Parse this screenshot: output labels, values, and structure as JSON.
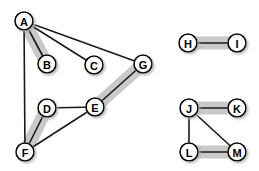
{
  "figure": {
    "background_color": "#ffffff",
    "width": 259,
    "height": 171
  },
  "style": {
    "node_fill": "#ffffff",
    "node_stroke": "#000000",
    "node_stroke_width": 1.6,
    "node_radius": 9,
    "node_label_color": "#000000",
    "node_label_size": 11,
    "edge_color": "#1a1a1a",
    "edge_width": 1.6,
    "highlight_color": "#c9c9c9",
    "highlight_width": 13,
    "node_shadow_color": "#b5b5b5"
  },
  "nodes": [
    {
      "id": "A",
      "label": "A",
      "x": 24,
      "y": 21
    },
    {
      "id": "B",
      "label": "B",
      "x": 47,
      "y": 64
    },
    {
      "id": "C",
      "label": "C",
      "x": 94,
      "y": 65
    },
    {
      "id": "D",
      "label": "D",
      "x": 47,
      "y": 108
    },
    {
      "id": "E",
      "label": "E",
      "x": 95,
      "y": 107
    },
    {
      "id": "F",
      "label": "F",
      "x": 25,
      "y": 152
    },
    {
      "id": "G",
      "label": "G",
      "x": 143,
      "y": 64
    },
    {
      "id": "H",
      "label": "H",
      "x": 188,
      "y": 43
    },
    {
      "id": "I",
      "label": "I",
      "x": 237,
      "y": 43
    },
    {
      "id": "J",
      "label": "J",
      "x": 189,
      "y": 108
    },
    {
      "id": "K",
      "label": "K",
      "x": 237,
      "y": 108
    },
    {
      "id": "L",
      "label": "L",
      "x": 189,
      "y": 152
    },
    {
      "id": "M",
      "label": "M",
      "x": 237,
      "y": 152
    }
  ],
  "edges": [
    {
      "source": "A",
      "target": "B",
      "highlighted": true
    },
    {
      "source": "A",
      "target": "C",
      "highlighted": false
    },
    {
      "source": "A",
      "target": "G",
      "highlighted": false
    },
    {
      "source": "A",
      "target": "F",
      "highlighted": false
    },
    {
      "source": "D",
      "target": "E",
      "highlighted": false
    },
    {
      "source": "D",
      "target": "F",
      "highlighted": true
    },
    {
      "source": "E",
      "target": "F",
      "highlighted": false
    },
    {
      "source": "E",
      "target": "G",
      "highlighted": true
    },
    {
      "source": "H",
      "target": "I",
      "highlighted": true
    },
    {
      "source": "J",
      "target": "K",
      "highlighted": true
    },
    {
      "source": "J",
      "target": "L",
      "highlighted": false
    },
    {
      "source": "J",
      "target": "M",
      "highlighted": false
    },
    {
      "source": "L",
      "target": "M",
      "highlighted": true
    }
  ],
  "components": [
    {
      "name": "component-1",
      "nodes": [
        "A",
        "B",
        "C",
        "D",
        "E",
        "F",
        "G"
      ]
    },
    {
      "name": "component-2",
      "nodes": [
        "H",
        "I"
      ]
    },
    {
      "name": "component-3",
      "nodes": [
        "J",
        "K",
        "L",
        "M"
      ]
    }
  ],
  "matching": {
    "name": "highlighted-matching",
    "edges": [
      "A-B",
      "D-F",
      "E-G",
      "H-I",
      "J-K",
      "L-M"
    ],
    "size": 6
  }
}
